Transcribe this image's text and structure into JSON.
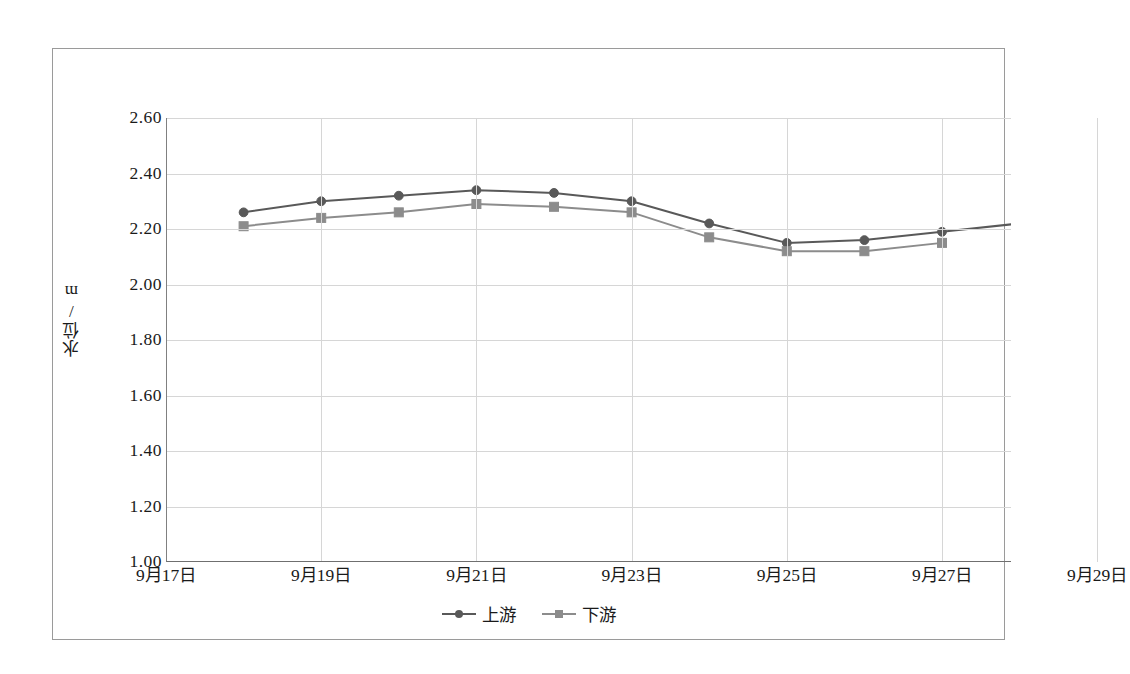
{
  "chart_data": {
    "type": "line",
    "title": "",
    "xlabel": "",
    "ylabel": "水位/m",
    "ylim": [
      1.0,
      2.6
    ],
    "yticks": [
      "1.00",
      "1.20",
      "1.40",
      "1.60",
      "1.80",
      "2.00",
      "2.20",
      "2.40",
      "2.60"
    ],
    "ytick_values": [
      1.0,
      1.2,
      1.4,
      1.6,
      1.8,
      2.0,
      2.2,
      2.4,
      2.6
    ],
    "xtick_labels": [
      "9月17日",
      "9月19日",
      "9月21日",
      "9月23日",
      "9月25日",
      "9月27日",
      "9月29日"
    ],
    "categories": [
      "9月17日",
      "9月18日",
      "9月19日",
      "9月20日",
      "9月21日",
      "9月22日",
      "9月23日",
      "9月24日",
      "9月25日",
      "9月26日",
      "9月27日",
      "9月28日",
      "9月29日"
    ],
    "grid": true,
    "legend_position": "bottom",
    "series": [
      {
        "name": "上游",
        "color": "#595959",
        "marker": "circle",
        "values": [
          null,
          2.26,
          2.3,
          2.32,
          2.34,
          2.33,
          2.3,
          2.22,
          2.15,
          2.16,
          2.19,
          2.22,
          null
        ]
      },
      {
        "name": "下游",
        "color": "#8c8c8c",
        "marker": "square",
        "values": [
          null,
          2.21,
          2.24,
          2.26,
          2.29,
          2.28,
          2.26,
          2.17,
          2.12,
          2.12,
          2.15,
          null,
          null
        ]
      }
    ]
  },
  "colors": {
    "upstream": "#595959",
    "downstream": "#8c8c8c",
    "grid": "#d6d6d6",
    "axis": "#808080",
    "frame": "#9a9a9a",
    "text": "#1a1a1a"
  },
  "legend": {
    "items": [
      {
        "label": "上游"
      },
      {
        "label": "下游"
      }
    ]
  }
}
